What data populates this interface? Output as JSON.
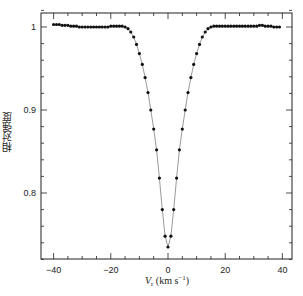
{
  "chart_data": {
    "type": "line",
    "title": "",
    "xlabel": "V_r (km s^-1)",
    "ylabel": "相对强度",
    "xlim": [
      -43,
      45
    ],
    "ylim": [
      0.72,
      1.034
    ],
    "x_ticks": [
      -40,
      -20,
      0,
      20,
      40
    ],
    "y_ticks": [
      0.8,
      0.9,
      1
    ],
    "x_tick_labels": [
      "-40",
      "-20",
      "0",
      "20",
      "40"
    ],
    "y_tick_labels": [
      "0.8",
      "0.9",
      "1"
    ],
    "grid": false,
    "legend": null,
    "marker": "filled-circle",
    "series": [
      {
        "name": "line profile",
        "x": [
          -40,
          -39,
          -38,
          -37,
          -36,
          -35,
          -34,
          -33,
          -32,
          -31,
          -30,
          -29,
          -28,
          -27,
          -26,
          -25,
          -24,
          -23,
          -22,
          -21,
          -20,
          -19,
          -18,
          -17,
          -16,
          -15,
          -14,
          -13,
          -12,
          -11,
          -10,
          -9,
          -8,
          -7,
          -6,
          -5,
          -4,
          -3,
          -2,
          -1,
          0,
          1,
          2,
          3,
          4,
          5,
          6,
          7,
          8,
          9,
          10,
          11,
          12,
          13,
          14,
          15,
          16,
          17,
          18,
          19,
          20,
          21,
          22,
          23,
          24,
          25,
          26,
          27,
          28,
          29,
          30,
          31,
          32,
          33,
          34,
          35,
          36,
          37,
          38,
          39
        ],
        "values": [
          1.003,
          1.003,
          1.003,
          1.002,
          1.002,
          1.002,
          1.001,
          1.001,
          1.001,
          1.0,
          1.0,
          1.0,
          1.0,
          1.0,
          1.0,
          1.0,
          1.0,
          1.0,
          1.0,
          1.0,
          1.001,
          1.001,
          1.001,
          1.001,
          1.001,
          1.0,
          0.998,
          0.994,
          0.988,
          0.979,
          0.968,
          0.955,
          0.939,
          0.921,
          0.9,
          0.877,
          0.852,
          0.818,
          0.78,
          0.748,
          0.735,
          0.748,
          0.78,
          0.818,
          0.852,
          0.877,
          0.9,
          0.921,
          0.939,
          0.955,
          0.968,
          0.979,
          0.988,
          0.994,
          0.998,
          1.0,
          1.001,
          1.001,
          1.001,
          1.001,
          1.001,
          1.001,
          1.001,
          1.001,
          1.001,
          1.001,
          1.001,
          1.001,
          1.001,
          1.001,
          1.001,
          1.001,
          1.002,
          1.002,
          1.001,
          1.001,
          1.001,
          1.0,
          1.0,
          1.0
        ]
      }
    ]
  },
  "axes": {
    "ylabel": "相对强度",
    "xlabel_main": "V",
    "xlabel_sub": "r",
    "xlabel_units": " (km s",
    "xlabel_exp": "−1",
    "xlabel_close": ")"
  }
}
